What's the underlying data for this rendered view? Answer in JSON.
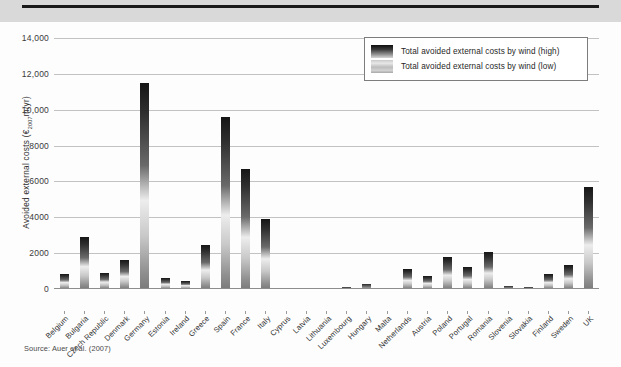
{
  "figure": {
    "source_note": "Source: Auer et al. (2007)"
  },
  "legend": {
    "items": [
      {
        "label": "Total avoided external costs by wind (high)",
        "swatch": "gradient-dark-swatch"
      },
      {
        "label": "Total avoided external costs by wind (low)",
        "swatch": "gradient-light-swatch"
      }
    ]
  },
  "chart_data": {
    "type": "bar",
    "title": "",
    "xlabel": "",
    "ylabel": "Avoided external costs (€2007m/yr)",
    "ylabel_prefix": "Avoided external costs (€",
    "ylabel_sub": "2007",
    "ylabel_suffix": "m/yr)",
    "ylim": [
      0,
      14000
    ],
    "ytick_values": [
      0,
      2000,
      4000,
      6000,
      8000,
      10000,
      12000,
      14000
    ],
    "ytick_labels": [
      "0",
      "2000",
      "4000",
      "6000",
      "8000",
      "10,000",
      "12,000",
      "14,000"
    ],
    "grid": true,
    "legend_position": "top-right",
    "categories": [
      "Belgium",
      "Bulgaria",
      "Czech Republic",
      "Denmark",
      "Germany",
      "Estonia",
      "Ireland",
      "Greece",
      "Spain",
      "France",
      "Italy",
      "Cyprus",
      "Latvia",
      "Lithuania",
      "Luxembourg",
      "Hungary",
      "Malta",
      "Netherlands",
      "Austria",
      "Poland",
      "Portugal",
      "Romania",
      "Slovenia",
      "Slovakia",
      "Finland",
      "Sweden",
      "UK"
    ],
    "series": [
      {
        "name": "Total avoided external costs by wind (low)",
        "values": [
          180,
          550,
          180,
          300,
          1950,
          120,
          90,
          450,
          1850,
          1300,
          750,
          20,
          20,
          30,
          10,
          60,
          10,
          220,
          180,
          350,
          250,
          420,
          40,
          30,
          160,
          280,
          1100
        ]
      },
      {
        "name": "Total avoided external costs by wind (high)",
        "values": [
          850,
          2900,
          900,
          1600,
          11500,
          600,
          450,
          2450,
          9600,
          6700,
          3900,
          40,
          40,
          60,
          120,
          300,
          30,
          1100,
          750,
          1800,
          1250,
          2050,
          180,
          120,
          850,
          1350,
          5700
        ]
      }
    ]
  }
}
